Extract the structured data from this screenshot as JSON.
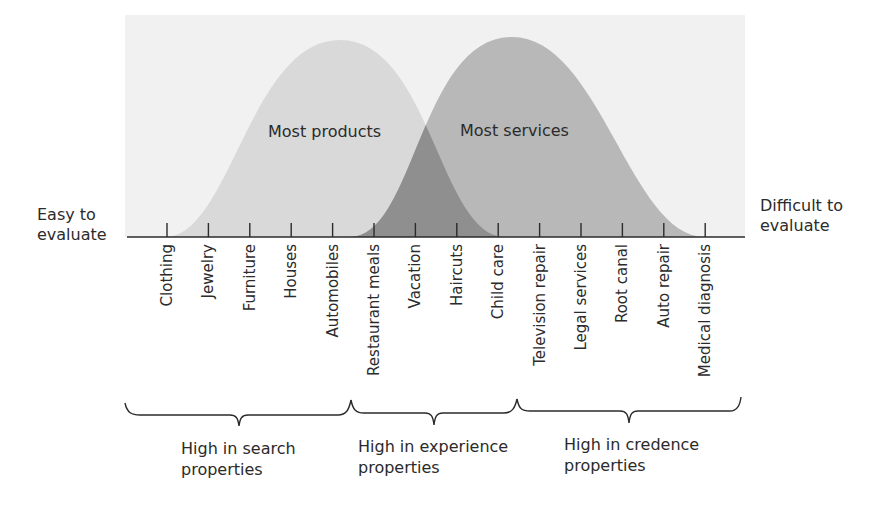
{
  "diagram": {
    "left_axis_label": [
      "Easy to",
      "evaluate"
    ],
    "right_axis_label": [
      "Difficult to",
      "evaluate"
    ],
    "curves": [
      {
        "label": "Most products",
        "color": "#d9d9d9"
      },
      {
        "label": "Most services",
        "color": "#b8b8b8"
      }
    ],
    "overlap_color": "#8f8f8f",
    "background_color": "#f1f1f1",
    "items": [
      "Clothing",
      "Jewelry",
      "Furniture",
      "Houses",
      "Automobiles",
      "Restaurant meals",
      "Vacation",
      "Haircuts",
      "Child care",
      "Television repair",
      "Legal services",
      "Root canal",
      "Auto repair",
      "Medical diagnosis"
    ],
    "groups": [
      {
        "line1": "High in search",
        "line2": "properties"
      },
      {
        "line1": "High in experience",
        "line2": "properties"
      },
      {
        "line1": "High in credence",
        "line2": "properties"
      }
    ]
  }
}
